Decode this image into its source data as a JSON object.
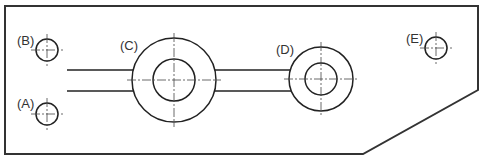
{
  "diagram": {
    "type": "technical-drawing",
    "colors": {
      "line": "#222222",
      "background": "#ffffff"
    },
    "outline_points": [
      [
        5,
        6
      ],
      [
        478,
        6
      ],
      [
        478,
        90
      ],
      [
        363,
        154
      ],
      [
        5,
        154
      ]
    ],
    "slot": {
      "x_start": 67,
      "y_top": 70,
      "y_bottom": 91
    },
    "features": [
      {
        "id": "A",
        "label": "(A)",
        "kind": "hole",
        "cx": 47,
        "cy": 114,
        "r": 11,
        "label_x": 17,
        "label_y": 108
      },
      {
        "id": "B",
        "label": "(B)",
        "kind": "hole",
        "cx": 47,
        "cy": 50,
        "r": 11,
        "label_x": 17,
        "label_y": 45
      },
      {
        "id": "C",
        "label": "(C)",
        "kind": "boss",
        "cx": 174,
        "cy": 80,
        "r_outer": 42,
        "r_inner": 21,
        "label_x": 120,
        "label_y": 50
      },
      {
        "id": "D",
        "label": "(D)",
        "kind": "boss",
        "cx": 321,
        "cy": 79,
        "r_outer": 32,
        "r_inner": 16,
        "label_x": 276,
        "label_y": 54
      },
      {
        "id": "E",
        "label": "(E)",
        "kind": "hole",
        "cx": 436,
        "cy": 48,
        "r": 11,
        "label_x": 406,
        "label_y": 43
      }
    ]
  }
}
